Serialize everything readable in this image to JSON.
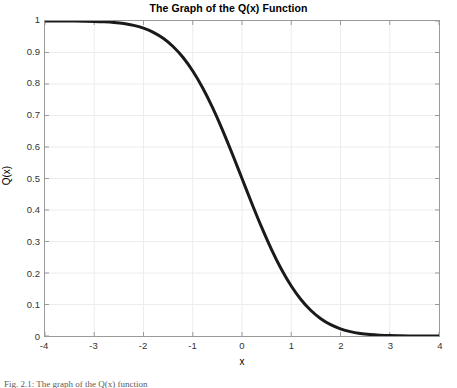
{
  "figure": {
    "caption": "Fig. 2.1: The graph of the Q(x) function"
  },
  "chart_data": {
    "type": "line",
    "title": "The Graph of the Q(x) Function",
    "xlabel": "x",
    "ylabel": "Q(x)",
    "xlim": [
      -4,
      4
    ],
    "ylim": [
      0,
      1
    ],
    "grid": true,
    "legend": null,
    "line_color": "#1a1a1a",
    "line_width": 3,
    "xticks": [
      "-4",
      "-3",
      "-2",
      "-1",
      "0",
      "1",
      "2",
      "3",
      "4"
    ],
    "xtick_values": [
      -4,
      -3,
      -2,
      -1,
      0,
      1,
      2,
      3,
      4
    ],
    "yticks": [
      "0",
      "0.1",
      "0.2",
      "0.3",
      "0.4",
      "0.5",
      "0.6",
      "0.7",
      "0.8",
      "0.9",
      "1"
    ],
    "ytick_values": [
      0,
      0.1,
      0.2,
      0.3,
      0.4,
      0.5,
      0.6,
      0.7,
      0.8,
      0.9,
      1
    ],
    "series": [
      {
        "name": "Q(x)",
        "x": [
          -4.0,
          -3.8,
          -3.6,
          -3.4,
          -3.2,
          -3.0,
          -2.8,
          -2.6,
          -2.4,
          -2.2,
          -2.0,
          -1.8,
          -1.6,
          -1.4,
          -1.2,
          -1.0,
          -0.8,
          -0.6,
          -0.4,
          -0.2,
          0.0,
          0.2,
          0.4,
          0.6,
          0.8,
          1.0,
          1.2,
          1.4,
          1.6,
          1.8,
          2.0,
          2.2,
          2.4,
          2.6,
          2.8,
          3.0,
          3.2,
          3.4,
          3.6,
          3.8,
          4.0
        ],
        "values": [
          1.0,
          0.9999,
          0.9998,
          0.9997,
          0.9993,
          0.9987,
          0.9974,
          0.9953,
          0.9918,
          0.9861,
          0.9772,
          0.9641,
          0.9452,
          0.9192,
          0.8849,
          0.8413,
          0.7881,
          0.7257,
          0.6554,
          0.5793,
          0.5,
          0.4207,
          0.3446,
          0.2743,
          0.2119,
          0.1587,
          0.1151,
          0.0808,
          0.0548,
          0.0359,
          0.0228,
          0.0139,
          0.0082,
          0.0047,
          0.0026,
          0.0013,
          0.0007,
          0.0003,
          0.0002,
          0.0001,
          0.0
        ]
      }
    ]
  }
}
